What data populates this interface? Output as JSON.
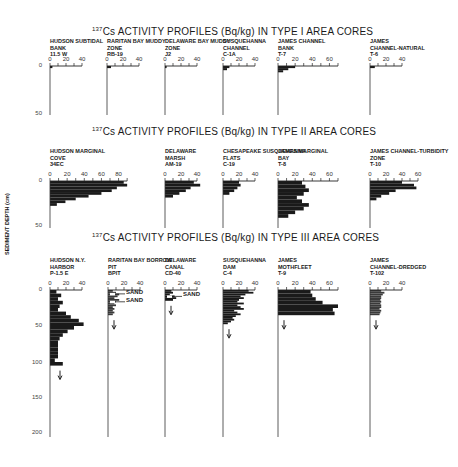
{
  "figure": {
    "ylabel": "SEDIMENT DEPTH (cm)",
    "sections": [
      {
        "id": "type1",
        "title_sup": "137",
        "title": "Cs ACTIVITY PROFILES (Bq/kg) IN TYPE I AREA CORES"
      },
      {
        "id": "type2",
        "title_sup": "137",
        "title": "Cs ACTIVITY PROFILES (Bq/kg) IN TYPE II AREA CORES"
      },
      {
        "id": "type3",
        "title_sup": "137",
        "title": "Cs ACTIVITY PROFILES (Bq/kg) IN TYPE III AREA CORES"
      }
    ],
    "depth_ticks": {
      "type1": [
        "0",
        "50"
      ],
      "type2": [
        "0",
        "50"
      ],
      "type3": [
        "0",
        "50",
        "100",
        "150",
        "200"
      ]
    },
    "annotations": {
      "sand": "SAND"
    }
  },
  "chart_data": [
    {
      "type": "bar",
      "section": "Type I",
      "title": "137Cs ACTIVITY PROFILES (Bq/kg) IN TYPE I AREA CORES",
      "xlabel": "Bq/kg",
      "ylabel": "SEDIMENT DEPTH (cm)",
      "ylim": [
        0,
        50
      ],
      "cores": [
        {
          "name": "HUDSON SUBTIDAL BANK",
          "id": "11.5 W",
          "xlim": [
            0,
            40
          ],
          "ticks": [
            "0",
            "20",
            "40"
          ],
          "depth": [
            0,
            2
          ],
          "values": [
            3
          ]
        },
        {
          "name": "RARITAN BAY MUDDY ZONE",
          "id": "RB-19",
          "xlim": [
            0,
            40
          ],
          "ticks": [
            "0",
            "20",
            "40"
          ],
          "depth": [
            0,
            2
          ],
          "values": [
            5
          ]
        },
        {
          "name": "DELAWARE BAY MUDDY ZONE",
          "id": "J2",
          "xlim": [
            0,
            40
          ],
          "ticks": [
            "0",
            "20",
            "40"
          ],
          "depth": [
            0,
            2
          ],
          "values": [
            2
          ]
        },
        {
          "name": "SUSQUEHANNA CHANNEL",
          "id": "C-1A",
          "xlim": [
            0,
            40
          ],
          "ticks": [
            "0",
            "20",
            "40"
          ],
          "depth": [
            0,
            2,
            4
          ],
          "values": [
            8,
            5
          ]
        },
        {
          "name": "JAMES CHANNEL BANK",
          "id": "T-7",
          "xlim": [
            0,
            70
          ],
          "ticks": [
            "0",
            "20",
            "40",
            "60"
          ],
          "depth": [
            0,
            2,
            4,
            6
          ],
          "values": [
            20,
            12,
            6
          ]
        },
        {
          "name": "JAMES CHANNEL-NATURAL",
          "id": "T-6",
          "xlim": [
            0,
            40
          ],
          "ticks": [
            "0",
            "20",
            "40"
          ],
          "depth": [
            0,
            2
          ],
          "values": [
            6
          ]
        }
      ]
    },
    {
      "type": "bar",
      "section": "Type II",
      "title": "137Cs ACTIVITY PROFILES (Bq/kg) IN TYPE II AREA CORES",
      "ylim": [
        0,
        50
      ],
      "cores": [
        {
          "name": "HUDSON MARGINAL COVE",
          "id": "34EC",
          "xlim": [
            0,
            90
          ],
          "ticks": [
            "0",
            "20",
            "40",
            "60",
            "80"
          ],
          "depth": [
            0,
            3,
            6,
            9,
            12,
            15,
            18,
            21,
            24,
            27
          ],
          "values": [
            86,
            90,
            78,
            72,
            60,
            45,
            30,
            18,
            8
          ]
        },
        {
          "name": "DELAWARE MARSH",
          "id": "AM-19",
          "xlim": [
            0,
            40
          ],
          "ticks": [
            "0",
            "20",
            "40"
          ],
          "depth": [
            0,
            3,
            6,
            9,
            12,
            15,
            18
          ],
          "values": [
            36,
            44,
            32,
            26,
            18,
            10
          ]
        },
        {
          "name": "CHESAPEAKE SUSQUEHANNA FLATS",
          "id": "C-19",
          "xlim": [
            0,
            40
          ],
          "ticks": [
            "0",
            "20",
            "40"
          ],
          "depth": [
            0,
            3,
            6,
            9,
            12,
            15
          ],
          "values": [
            20,
            22,
            18,
            14,
            8
          ]
        },
        {
          "name": "JAMES MARGINAL BAY",
          "id": "T-8",
          "xlim": [
            0,
            70
          ],
          "ticks": [
            "0",
            "20",
            "40",
            "60"
          ],
          "depth": [
            0,
            4,
            8,
            12,
            16,
            20,
            24,
            28,
            32,
            36,
            40
          ],
          "values": [
            28,
            32,
            36,
            30,
            22,
            28,
            36,
            30,
            20,
            12
          ]
        },
        {
          "name": "JAMES CHANNEL-TURBIDITY ZONE",
          "id": "T-10",
          "xlim": [
            0,
            60
          ],
          "ticks": [
            "0",
            "20",
            "40",
            "60"
          ],
          "depth": [
            0,
            3,
            6,
            9,
            12,
            15,
            18,
            21
          ],
          "values": [
            40,
            55,
            58,
            32,
            24,
            14,
            8
          ]
        }
      ]
    },
    {
      "type": "bar",
      "section": "Type III",
      "title": "137Cs ACTIVITY PROFILES (Bq/kg) IN TYPE III AREA CORES",
      "ylim": [
        0,
        210
      ],
      "cores": [
        {
          "name": "HUDSON N.Y. HARBOR",
          "id": "P-1.5 E",
          "xlim": [
            0,
            40
          ],
          "ticks": [
            "0",
            "20",
            "40"
          ],
          "depth": [
            0,
            10,
            20,
            30,
            40,
            50,
            60,
            70,
            80,
            90,
            100,
            110,
            120,
            130,
            140,
            150,
            160,
            170,
            180,
            190,
            200,
            210
          ],
          "values": [
            8,
            14,
            10,
            16,
            12,
            10,
            20,
            26,
            36,
            42,
            30,
            22,
            16,
            12,
            10,
            10,
            10,
            10,
            10,
            6,
            16
          ]
        },
        {
          "name": "RARITAN BAY BORROW PIT",
          "id": "BPIT",
          "xlim": [
            0,
            40
          ],
          "ticks": [
            "0",
            "20",
            "40"
          ],
          "depth": [
            0,
            5,
            10,
            15,
            20,
            25,
            30,
            35,
            40,
            45,
            50,
            55,
            60,
            65,
            70
          ],
          "values": [
            6,
            10,
            14,
            12,
            8,
            14,
            10,
            8,
            10,
            6,
            8,
            6,
            8,
            6
          ],
          "sand_layers_cm": [
            8,
            30
          ]
        },
        {
          "name": "DELAWARE CANAL",
          "id": "CD-40",
          "xlim": [
            0,
            40
          ],
          "ticks": [
            "0",
            "20",
            "40"
          ],
          "depth": [
            0,
            5,
            10,
            15,
            20,
            25,
            30
          ],
          "values": [
            8,
            10,
            6,
            12,
            14,
            10
          ],
          "sand_layers_cm": [
            15
          ]
        },
        {
          "name": "SUSQUEHANNA DAM",
          "id": "C-4",
          "xlim": [
            0,
            40
          ],
          "ticks": [
            "0",
            "20",
            "40"
          ],
          "depth": [
            0,
            5,
            10,
            15,
            20,
            25,
            30,
            35,
            40,
            45,
            50,
            55,
            60,
            65,
            70,
            75,
            80,
            85,
            90,
            95
          ],
          "values": [
            32,
            38,
            28,
            22,
            26,
            20,
            18,
            26,
            18,
            22,
            26,
            14,
            18,
            22,
            16,
            12,
            14,
            10,
            6
          ]
        },
        {
          "name": "JAMES MOTHFLEET",
          "id": "T-9",
          "xlim": [
            0,
            70
          ],
          "ticks": [
            "0",
            "20",
            "40",
            "60"
          ],
          "depth": [
            0,
            10,
            20,
            30,
            40,
            50,
            60,
            70
          ],
          "values": [
            38,
            40,
            44,
            52,
            70,
            64,
            66
          ]
        },
        {
          "name": "JAMES CHANNEL-DREDGED",
          "id": "T-102",
          "xlim": [
            0,
            40
          ],
          "ticks": [
            "0",
            "20",
            "40"
          ],
          "depth": [
            0,
            5,
            10,
            15,
            20,
            25,
            30,
            35,
            40,
            45,
            50,
            55,
            60,
            65,
            70
          ],
          "values": [
            14,
            18,
            16,
            14,
            14,
            13,
            14,
            13,
            14,
            14,
            12,
            14,
            13,
            12
          ]
        }
      ]
    }
  ]
}
